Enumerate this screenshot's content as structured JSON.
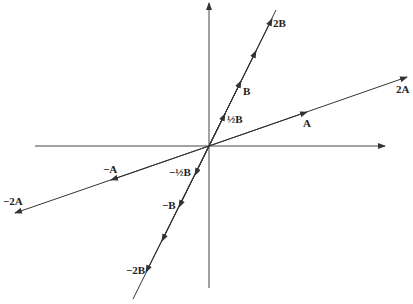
{
  "diagram": {
    "type": "vector scalar multiples",
    "origin": [
      209,
      146
    ],
    "axes": {
      "horizontal": "x-axis",
      "vertical": "y-axis"
    },
    "colors": {
      "line": "#333333",
      "text": "#222222",
      "background": "#ffffff"
    },
    "labels": {
      "twoB": "2B",
      "B": "B",
      "halfB": "½B",
      "twoA": "2A",
      "A": "A",
      "negA": "−A",
      "negTwoA": "−2A",
      "negHalfB": "−½B",
      "negB": "−B",
      "negTwoB": "−2B"
    }
  }
}
